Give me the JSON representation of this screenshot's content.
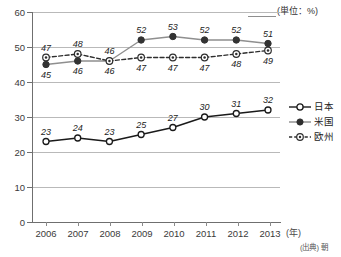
{
  "chart_data": {
    "type": "line",
    "title": "",
    "subtitle": "",
    "unit_caption": "(単位：%)",
    "xlabel": "(年)",
    "ylabel": "",
    "x": [
      "2006",
      "2007",
      "2008",
      "2009",
      "2010",
      "2011",
      "2012",
      "2013"
    ],
    "categories": [
      "2006",
      "2007",
      "2008",
      "2009",
      "2010",
      "2011",
      "2012",
      "2013"
    ],
    "series": [
      {
        "name": "日本",
        "values": [
          23,
          24,
          23,
          25,
          27,
          30,
          31,
          32
        ],
        "marker": "open-circle",
        "line_style": "solid",
        "color": "#1a1a1a"
      },
      {
        "name": "米国",
        "values": [
          45,
          46,
          46,
          52,
          53,
          52,
          52,
          51
        ],
        "marker": "filled-circle",
        "line_style": "solid",
        "color": "#8c8c8c"
      },
      {
        "name": "欧州",
        "values": [
          47,
          48,
          46,
          47,
          47,
          47,
          48,
          49
        ],
        "marker": "dotted-circle",
        "line_style": "dashed",
        "color": "#2e2e2e"
      }
    ],
    "ylim": [
      0,
      60
    ],
    "yticks": [
      0,
      10,
      20,
      30,
      40,
      50,
      60
    ],
    "ytick_labels": [
      "0",
      "10",
      "20",
      "30",
      "40",
      "50",
      "60"
    ],
    "grid": true,
    "grid_axis": "y",
    "legend_position": "right",
    "data_labels": true
  },
  "axes": {
    "y_labels": [
      "60",
      "50",
      "40",
      "30",
      "20",
      "10",
      "0"
    ],
    "x_labels": [
      "2006",
      "2007",
      "2008",
      "2009",
      "2010",
      "2011",
      "2012",
      "2013"
    ],
    "x_unit": "(年)",
    "unit_caption": "(単位：%)"
  },
  "legend": {
    "items": [
      {
        "label": "日本",
        "marker": "open-circle",
        "line": "solid"
      },
      {
        "label": "米国",
        "marker": "filled-circle",
        "line": "solid"
      },
      {
        "label": "欧州",
        "marker": "dotted-circle",
        "line": "dashed"
      }
    ]
  },
  "labels": {
    "japan": [
      "23",
      "24",
      "23",
      "25",
      "27",
      "30",
      "31",
      "32"
    ],
    "usa": [
      "45",
      "46",
      "46",
      "52",
      "53",
      "52",
      "52",
      "51"
    ],
    "europe": [
      "47",
      "48",
      "46",
      "47",
      "47",
      "47",
      "48",
      "49"
    ]
  },
  "source": {
    "text": "(出典) 朝"
  },
  "colors": {
    "japan": "#1a1a1a",
    "usa": "#8c8c8c",
    "europe": "#2e2e2e",
    "grid": "#b9b9b9",
    "axis": "#6f6f6f",
    "background": "#ffffff"
  }
}
